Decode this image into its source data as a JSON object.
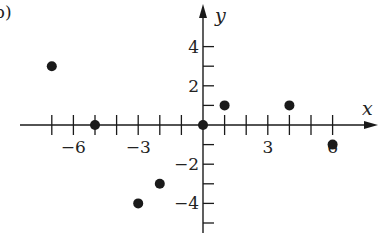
{
  "chart_data": {
    "type": "scatter",
    "panel_label": "b)",
    "title": "",
    "xlabel": "x",
    "ylabel": "y",
    "xlim": [
      -8.5,
      8
    ],
    "ylim": [
      -5.5,
      6
    ],
    "x_ticks": [
      -7,
      -6,
      -5,
      -4,
      -3,
      -2,
      -1,
      1,
      2,
      3,
      4,
      5,
      6
    ],
    "y_ticks": [
      -5,
      -4,
      -3,
      -2,
      -1,
      1,
      2,
      3,
      4
    ],
    "x_tick_labels": [
      {
        "value": -6,
        "text": "−6"
      },
      {
        "value": -3,
        "text": "−3"
      },
      {
        "value": 3,
        "text": "3"
      },
      {
        "value": 6,
        "text": "6"
      }
    ],
    "y_tick_labels": [
      {
        "value": 4,
        "text": "4"
      },
      {
        "value": 2,
        "text": "2"
      },
      {
        "value": -2,
        "text": "−2"
      },
      {
        "value": -4,
        "text": "−4"
      }
    ],
    "grid": false,
    "points": [
      {
        "x": -7,
        "y": 3
      },
      {
        "x": -5,
        "y": 0
      },
      {
        "x": -3,
        "y": -4
      },
      {
        "x": -2,
        "y": -3
      },
      {
        "x": 0,
        "y": 0
      },
      {
        "x": 1,
        "y": 1
      },
      {
        "x": 4,
        "y": 1
      },
      {
        "x": 6,
        "y": -1
      }
    ],
    "point_color": "#1a1a1a",
    "axis_color": "#1a1a1a"
  }
}
